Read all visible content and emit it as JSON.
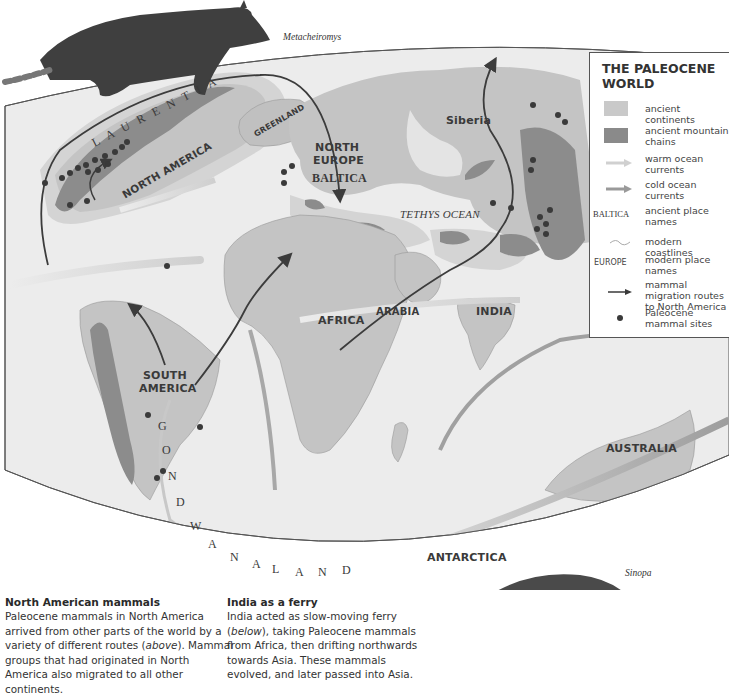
{
  "legend": {
    "title_line1": "THE PALEOCENE",
    "title_line2": "WORLD",
    "items": [
      {
        "symbol": "ancient-continents-swatch",
        "label": "ancient continents",
        "color": "#c9c9c9"
      },
      {
        "symbol": "mountain-swatch",
        "label": "ancient mountain chains",
        "color": "#8a8a8a"
      },
      {
        "symbol": "warm-current-arrow",
        "label": "warm ocean currents",
        "color": "#d0d0d0"
      },
      {
        "symbol": "cold-current-arrow",
        "label": "cold ocean currents",
        "color": "#9a9a9a"
      },
      {
        "symbol": "ancient-place-name-sample",
        "sample": "BALTICA",
        "label": "ancient place names"
      },
      {
        "symbol": "modern-coastline-line",
        "label": "modern coastlines"
      },
      {
        "symbol": "modern-place-name-sample",
        "sample": "EUROPE",
        "label": "modern place names"
      },
      {
        "symbol": "migration-arrow",
        "label": "mammal migration routes to North America",
        "color": "#3a3a3a"
      },
      {
        "symbol": "site-dot",
        "label": "Paleocene mammal sites",
        "color": "#3a3a3a"
      }
    ]
  },
  "map": {
    "labels": {
      "laurentia": "L A U R E N T I A",
      "north_america": "NORTH AMERICA",
      "greenland": "GREENLAND",
      "north_europe_1": "NORTH",
      "north_europe_2": "EUROPE",
      "baltica": "BALTICA",
      "siberia": "Siberia",
      "tethys": "TETHYS OCEAN",
      "africa": "AFRICA",
      "arabia": "ARABIA",
      "india": "INDIA",
      "south_america_1": "SOUTH",
      "south_america_2": "AMERICA",
      "australia": "AUSTRALIA",
      "antarctica": "ANTARCTICA",
      "gondwanaland": [
        "G",
        "O",
        "N",
        "D",
        "W",
        "A",
        "N",
        "A",
        "L",
        "A",
        "N",
        "D"
      ]
    },
    "colors": {
      "ocean": "#eaeaea",
      "continent": "#c6c6c6",
      "shelf": "#d8d8d8",
      "mountain": "#8c8c8c",
      "route": "#3c3c3c"
    }
  },
  "illustrations": {
    "top_species": "Metacheiromys",
    "bottom_species": "Sinopa"
  },
  "captions": [
    {
      "title": "North American mammals",
      "body_1": "Paleocene mammals in North America arrived from other parts of the world by a variety of different routes (",
      "body_em": "above",
      "body_2": "). Mammal groups that had originated in North America also migrated to all other continents."
    },
    {
      "title": "India as a ferry",
      "body_1": "India acted as slow-moving ferry (",
      "body_em": "below",
      "body_2": "), taking Paleocene mammals from Africa, then drifting northwards towards Asia. These mammals evolved, and later passed into Asia."
    }
  ]
}
